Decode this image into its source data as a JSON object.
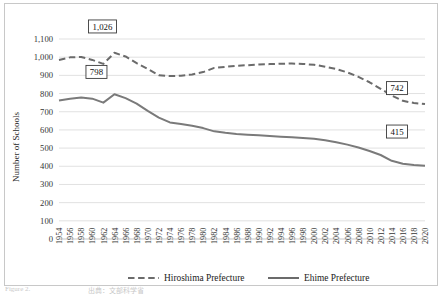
{
  "chart_data": {
    "type": "line",
    "title": "",
    "xlabel": "",
    "ylabel": "Number of Schools",
    "ylim": [
      0,
      1100
    ],
    "ytick_step": 100,
    "yticks": [
      "0",
      "100",
      "200",
      "300",
      "400",
      "500",
      "600",
      "700",
      "800",
      "900",
      "1,000",
      "1,100"
    ],
    "grid": true,
    "legend_position": "bottom",
    "categories": [
      "1954",
      "1956",
      "1958",
      "1960",
      "1962",
      "1964",
      "1966",
      "1968",
      "1970",
      "1972",
      "1974",
      "1976",
      "1978",
      "1980",
      "1982",
      "1984",
      "1986",
      "1988",
      "1990",
      "1992",
      "1994",
      "1996",
      "1998",
      "2000",
      "2002",
      "2004",
      "2006",
      "2008",
      "2010",
      "2012",
      "2014",
      "2016",
      "2018",
      "2020"
    ],
    "series": [
      {
        "name": "Hiroshima Prefecture",
        "style": "dashed",
        "color": "#6b6b6b",
        "values": [
          985,
          999,
          1001,
          985,
          963,
          1024,
          1004,
          967,
          935,
          901,
          896,
          898,
          905,
          918,
          941,
          947,
          953,
          956,
          960,
          962,
          964,
          965,
          963,
          958,
          948,
          935,
          916,
          892,
          862,
          826,
          789,
          760,
          748,
          742
        ]
      },
      {
        "name": "Ehime Prefecture",
        "style": "solid",
        "color": "#7a7a7a",
        "values": [
          762,
          772,
          778,
          772,
          750,
          796,
          775,
          745,
          705,
          668,
          641,
          633,
          623,
          610,
          592,
          584,
          578,
          574,
          570,
          566,
          563,
          560,
          556,
          551,
          543,
          532,
          519,
          503,
          484,
          462,
          430,
          414,
          407,
          403
        ]
      }
    ],
    "annotations": [
      {
        "name": "hiroshima-peak",
        "text": "1,026",
        "category": "1964",
        "value": 1026
      },
      {
        "name": "ehime-peak",
        "text": "798",
        "category": "1964",
        "value": 798
      },
      {
        "name": "hiroshima-end",
        "text": "742",
        "category": "2020",
        "value": 742
      },
      {
        "name": "ehime-end",
        "text": "415",
        "category": "2020",
        "value": 415
      }
    ]
  },
  "legend": {
    "items": [
      {
        "label": "Hiroshima Prefecture",
        "style": "dashed"
      },
      {
        "label": "Ehime Prefecture",
        "style": "solid"
      }
    ]
  },
  "caption": {
    "fragment_left": "Figure 2.",
    "fragment_mid": "出典：文部科学省"
  }
}
